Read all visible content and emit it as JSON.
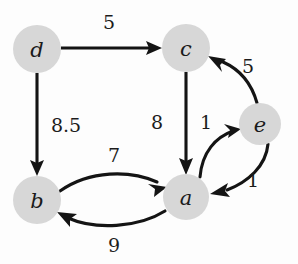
{
  "figure": {
    "kind": "weighted-directed-graph",
    "background_color": "#fdfdfd",
    "node_fill_color": "#d7d7d7",
    "edge_color": "#141414",
    "label_color": "#1c1c1c"
  },
  "nodes": [
    {
      "id": "d",
      "label": "d",
      "cx": 37,
      "cy": 49,
      "r": 24
    },
    {
      "id": "c",
      "label": "c",
      "cx": 186,
      "cy": 48,
      "r": 24
    },
    {
      "id": "e",
      "label": "e",
      "cx": 260,
      "cy": 124,
      "r": 21
    },
    {
      "id": "b",
      "label": "b",
      "cx": 37,
      "cy": 200,
      "r": 24
    },
    {
      "id": "a",
      "label": "a",
      "cx": 186,
      "cy": 197,
      "r": 23
    }
  ],
  "edges": [
    {
      "id": "d-c",
      "from": "d",
      "to": "c",
      "weight": "5",
      "label_x": 109,
      "label_y": 22,
      "style": "straight"
    },
    {
      "id": "d-b",
      "from": "d",
      "to": "b",
      "weight": "8.5",
      "label_x": 66,
      "label_y": 125,
      "style": "straight"
    },
    {
      "id": "c-a",
      "from": "c",
      "to": "a",
      "weight": "8",
      "label_x": 157,
      "label_y": 122,
      "style": "straight"
    },
    {
      "id": "a-e",
      "from": "a",
      "to": "e",
      "weight": "1",
      "label_x": 206,
      "label_y": 122,
      "style": "curved"
    },
    {
      "id": "e-a",
      "from": "e",
      "to": "a",
      "weight": "1",
      "label_x": 253,
      "label_y": 180,
      "style": "curved"
    },
    {
      "id": "e-c",
      "from": "e",
      "to": "c",
      "weight": "5",
      "label_x": 248,
      "label_y": 66,
      "style": "curved"
    },
    {
      "id": "b-a",
      "from": "b",
      "to": "a",
      "weight": "7",
      "label_x": 114,
      "label_y": 155,
      "style": "curved"
    },
    {
      "id": "a-b",
      "from": "a",
      "to": "b",
      "weight": "9",
      "label_x": 114,
      "label_y": 245,
      "style": "curved"
    }
  ]
}
